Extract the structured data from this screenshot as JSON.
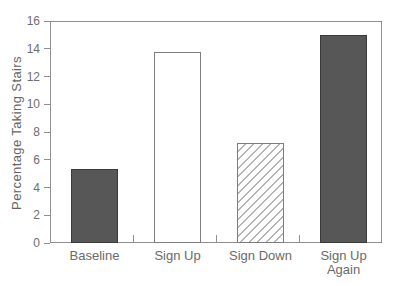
{
  "figure": {
    "background": "#ffffff"
  },
  "chart_data": {
    "type": "bar",
    "title": "",
    "xlabel": "",
    "ylabel": "Percentage Taking Stairs",
    "categories": [
      "Baseline",
      "Sign Up",
      "Sign Down",
      "Sign Up Again"
    ],
    "categories_display": [
      "Baseline",
      "Sign Up",
      "Sign Down",
      "Sign Up\nAgain"
    ],
    "values": [
      5.3,
      13.8,
      7.2,
      15.0
    ],
    "ylim": [
      0,
      16
    ],
    "yticks": [
      0,
      2,
      4,
      6,
      8,
      10,
      12,
      14,
      16
    ],
    "grid": false,
    "legend": false,
    "bar_styles": [
      "solid-dark",
      "white",
      "hatched",
      "solid-dark"
    ],
    "colors": {
      "bar_dark": "#575757",
      "bar_dark_border": "#3a3a3a",
      "bar_white": "#ffffff",
      "bar_light_border": "#7d7d7d",
      "hatch_line": "#b2b2b2",
      "axis": "#8f8f8f",
      "text": "#6a6a6a",
      "background": "#ffffff"
    }
  }
}
